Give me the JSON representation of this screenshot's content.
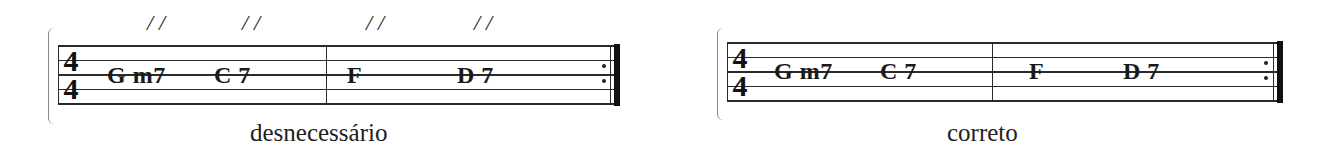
{
  "examples": [
    {
      "id": "left",
      "caption": "desnecessário",
      "time_signature": {
        "top": "4",
        "bottom": "4"
      },
      "slash_marks": [
        "//",
        "//",
        "//",
        "//"
      ],
      "measures": [
        {
          "chords": [
            "G m7",
            "C 7"
          ]
        },
        {
          "chords": [
            "F",
            "D 7"
          ]
        }
      ],
      "end_barline": "repeat-end"
    },
    {
      "id": "right",
      "caption": "correto",
      "time_signature": {
        "top": "4",
        "bottom": "4"
      },
      "slash_marks": [],
      "measures": [
        {
          "chords": [
            "G m7",
            "C 7"
          ]
        },
        {
          "chords": [
            "F",
            "D 7"
          ]
        }
      ],
      "end_barline": "repeat-end"
    }
  ]
}
